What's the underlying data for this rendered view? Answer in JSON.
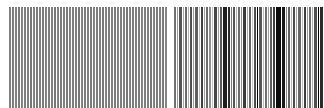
{
  "figure": {
    "kind": "barcode-stripe-pattern",
    "width": 324,
    "height": 108,
    "background_color": "#ffffff"
  },
  "chart_data": {
    "type": "bar",
    "subtitle": "",
    "xlabel": "",
    "ylabel": "",
    "grid": false,
    "legend": null,
    "axis_ticks": [],
    "annotations": [],
    "xlim": [
      0,
      324
    ],
    "ylim": [
      0,
      108
    ],
    "bar_top": 7,
    "bar_bottom": 108,
    "background_color": "#ffffff",
    "regions": [
      {
        "name": "regular-grating",
        "x_start": 8,
        "x_end": 168,
        "description": "uniform periodic grating, ~3px period, constant mid-gray bars",
        "period": 3,
        "bar_color": "#808080"
      },
      {
        "name": "separator-gap",
        "x_start": 168,
        "x_end": 174,
        "description": "wide white quiet zone separating the two halves",
        "bar_color": "#ffffff"
      },
      {
        "name": "irregular-barcode",
        "x_start": 174,
        "x_end": 324,
        "description": "irregular bars of varying width and darkness",
        "bar_color": "#000000"
      }
    ],
    "categories": [
      "b1",
      "b2",
      "b3",
      "b4",
      "b5",
      "b6",
      "b7",
      "b8",
      "b9",
      "b10",
      "b11",
      "b12",
      "b13",
      "b14",
      "b15",
      "b16",
      "b17",
      "b18",
      "b19",
      "b20",
      "b21",
      "b22",
      "b23",
      "b24",
      "b25",
      "b26",
      "b27",
      "b28",
      "b29",
      "b30",
      "b31",
      "b32",
      "b33",
      "b34",
      "b35",
      "b36",
      "b37",
      "b38",
      "b39",
      "b40",
      "b41",
      "b42",
      "b43",
      "b44",
      "b45",
      "b46",
      "b47",
      "b48",
      "b49",
      "b50",
      "b51",
      "b52",
      "b53",
      "b54",
      "b55",
      "b56",
      "b57",
      "b58",
      "b59",
      "b60",
      "b61",
      "b62",
      "b63",
      "b64",
      "b65",
      "b66",
      "b67",
      "b68",
      "b69",
      "b70",
      "b71",
      "b72",
      "b73",
      "b74",
      "b75",
      "b76",
      "b77",
      "b78",
      "b79",
      "b80",
      "b81",
      "b82",
      "b83",
      "b84",
      "b85",
      "b86",
      "b87",
      "b88",
      "b89",
      "b90",
      "b91",
      "b92",
      "b93",
      "b94",
      "b95",
      "b96",
      "b97",
      "b98",
      "b99",
      "b100",
      "b101",
      "b102",
      "b103",
      "b104",
      "b105",
      "b106",
      "b107",
      "b108",
      "b109",
      "b110",
      "b111",
      "b112",
      "b113",
      "b114",
      "b115",
      "b116",
      "b117",
      "b118",
      "b119",
      "b120",
      "b121",
      "b122",
      "b123",
      "b124",
      "b125",
      "b126",
      "b127",
      "b128",
      "b129",
      "b130"
    ],
    "bars": [
      {
        "x": 9,
        "w": 2,
        "c": "#808080"
      },
      {
        "x": 12,
        "w": 2,
        "c": "#7d7d7d"
      },
      {
        "x": 15,
        "w": 2,
        "c": "#808080"
      },
      {
        "x": 18,
        "w": 2,
        "c": "#7a7a7a"
      },
      {
        "x": 21,
        "w": 2,
        "c": "#828282"
      },
      {
        "x": 24,
        "w": 2,
        "c": "#7d7d7d"
      },
      {
        "x": 27,
        "w": 2,
        "c": "#808080"
      },
      {
        "x": 30,
        "w": 2,
        "c": "#787878"
      },
      {
        "x": 33,
        "w": 2,
        "c": "#828282"
      },
      {
        "x": 36,
        "w": 2,
        "c": "#7d7d7d"
      },
      {
        "x": 39,
        "w": 2,
        "c": "#808080"
      },
      {
        "x": 42,
        "w": 2,
        "c": "#7a7a7a"
      },
      {
        "x": 45,
        "w": 2,
        "c": "#828282"
      },
      {
        "x": 48,
        "w": 2,
        "c": "#7d7d7d"
      },
      {
        "x": 51,
        "w": 2,
        "c": "#808080"
      },
      {
        "x": 54,
        "w": 2,
        "c": "#787878"
      },
      {
        "x": 57,
        "w": 2,
        "c": "#828282"
      },
      {
        "x": 60,
        "w": 2,
        "c": "#7d7d7d"
      },
      {
        "x": 63,
        "w": 2,
        "c": "#808080"
      },
      {
        "x": 66,
        "w": 2,
        "c": "#7a7a7a"
      },
      {
        "x": 69,
        "w": 2,
        "c": "#828282"
      },
      {
        "x": 72,
        "w": 2,
        "c": "#7d7d7d"
      },
      {
        "x": 75,
        "w": 2,
        "c": "#808080"
      },
      {
        "x": 78,
        "w": 2,
        "c": "#787878"
      },
      {
        "x": 81,
        "w": 2,
        "c": "#828282"
      },
      {
        "x": 84,
        "w": 2,
        "c": "#7d7d7d"
      },
      {
        "x": 87,
        "w": 2,
        "c": "#808080"
      },
      {
        "x": 90,
        "w": 2,
        "c": "#7a7a7a"
      },
      {
        "x": 93,
        "w": 2,
        "c": "#828282"
      },
      {
        "x": 96,
        "w": 2,
        "c": "#7d7d7d"
      },
      {
        "x": 99,
        "w": 2,
        "c": "#808080"
      },
      {
        "x": 102,
        "w": 2,
        "c": "#787878"
      },
      {
        "x": 105,
        "w": 2,
        "c": "#828282"
      },
      {
        "x": 108,
        "w": 2,
        "c": "#7d7d7d"
      },
      {
        "x": 111,
        "w": 2,
        "c": "#808080"
      },
      {
        "x": 114,
        "w": 2,
        "c": "#7a7a7a"
      },
      {
        "x": 117,
        "w": 2,
        "c": "#828282"
      },
      {
        "x": 120,
        "w": 2,
        "c": "#7d7d7d"
      },
      {
        "x": 123,
        "w": 2,
        "c": "#808080"
      },
      {
        "x": 126,
        "w": 2,
        "c": "#787878"
      },
      {
        "x": 129,
        "w": 2,
        "c": "#828282"
      },
      {
        "x": 132,
        "w": 2,
        "c": "#7d7d7d"
      },
      {
        "x": 135,
        "w": 2,
        "c": "#808080"
      },
      {
        "x": 138,
        "w": 2,
        "c": "#7a7a7a"
      },
      {
        "x": 141,
        "w": 2,
        "c": "#828282"
      },
      {
        "x": 144,
        "w": 2,
        "c": "#7d7d7d"
      },
      {
        "x": 147,
        "w": 2,
        "c": "#808080"
      },
      {
        "x": 150,
        "w": 2,
        "c": "#787878"
      },
      {
        "x": 153,
        "w": 2,
        "c": "#828282"
      },
      {
        "x": 156,
        "w": 2,
        "c": "#7d7d7d"
      },
      {
        "x": 159,
        "w": 2,
        "c": "#808080"
      },
      {
        "x": 162,
        "w": 2,
        "c": "#7a7a7a"
      },
      {
        "x": 165,
        "w": 2,
        "c": "#858585"
      },
      {
        "x": 174,
        "w": 2,
        "c": "#6e6e6e"
      },
      {
        "x": 177,
        "w": 1,
        "c": "#9a9a9a"
      },
      {
        "x": 179,
        "w": 3,
        "c": "#545454"
      },
      {
        "x": 183,
        "w": 1,
        "c": "#a8a8a8"
      },
      {
        "x": 185,
        "w": 2,
        "c": "#6a6a6a"
      },
      {
        "x": 188,
        "w": 1,
        "c": "#b4b4b4"
      },
      {
        "x": 190,
        "w": 2,
        "c": "#4e4e4e"
      },
      {
        "x": 193,
        "w": 1,
        "c": "#9c9c9c"
      },
      {
        "x": 195,
        "w": 3,
        "c": "#5f5f5f"
      },
      {
        "x": 199,
        "w": 1,
        "c": "#bcbcbc"
      },
      {
        "x": 201,
        "w": 2,
        "c": "#3f3f3f"
      },
      {
        "x": 204,
        "w": 1,
        "c": "#a2a2a2"
      },
      {
        "x": 206,
        "w": 2,
        "c": "#6b6b6b"
      },
      {
        "x": 209,
        "w": 2,
        "c": "#8d8d8d"
      },
      {
        "x": 212,
        "w": 1,
        "c": "#c4c4c4"
      },
      {
        "x": 214,
        "w": 3,
        "c": "#474747"
      },
      {
        "x": 218,
        "w": 1,
        "c": "#9e9e9e"
      },
      {
        "x": 220,
        "w": 2,
        "c": "#5a5a5a"
      },
      {
        "x": 223,
        "w": 4,
        "c": "#1f1f1f"
      },
      {
        "x": 228,
        "w": 2,
        "c": "#2d2d2d"
      },
      {
        "x": 231,
        "w": 1,
        "c": "#7b7b7b"
      },
      {
        "x": 233,
        "w": 2,
        "c": "#565656"
      },
      {
        "x": 236,
        "w": 1,
        "c": "#b0b0b0"
      },
      {
        "x": 238,
        "w": 2,
        "c": "#6d6d6d"
      },
      {
        "x": 241,
        "w": 1,
        "c": "#8f8f8f"
      },
      {
        "x": 243,
        "w": 3,
        "c": "#3a3a3a"
      },
      {
        "x": 247,
        "w": 1,
        "c": "#a6a6a6"
      },
      {
        "x": 249,
        "w": 2,
        "c": "#636363"
      },
      {
        "x": 252,
        "w": 1,
        "c": "#c8c8c8"
      },
      {
        "x": 254,
        "w": 2,
        "c": "#4c4c4c"
      },
      {
        "x": 257,
        "w": 1,
        "c": "#9494949"
      },
      {
        "x": 259,
        "w": 3,
        "c": "#585858"
      },
      {
        "x": 263,
        "w": 1,
        "c": "#bdbdbd"
      },
      {
        "x": 265,
        "w": 2,
        "c": "#707070"
      },
      {
        "x": 268,
        "w": 1,
        "c": "#a0a0a0"
      },
      {
        "x": 270,
        "w": 2,
        "c": "#5d5d5d"
      },
      {
        "x": 273,
        "w": 2,
        "c": "#3c3c3c"
      },
      {
        "x": 276,
        "w": 5,
        "c": "#0c0c0c"
      },
      {
        "x": 282,
        "w": 3,
        "c": "#1a1a1a"
      },
      {
        "x": 286,
        "w": 1,
        "c": "#8a8a8a"
      },
      {
        "x": 288,
        "w": 2,
        "c": "#606060"
      },
      {
        "x": 291,
        "w": 1,
        "c": "#b8b8b8"
      },
      {
        "x": 293,
        "w": 2,
        "c": "#4a4a4a"
      },
      {
        "x": 296,
        "w": 1,
        "c": "#a4a4a4"
      },
      {
        "x": 298,
        "w": 3,
        "c": "#666666"
      },
      {
        "x": 302,
        "w": 1,
        "c": "#c0c0c0"
      },
      {
        "x": 304,
        "w": 2,
        "c": "#3e3e3e"
      },
      {
        "x": 307,
        "w": 1,
        "c": "#989898"
      },
      {
        "x": 309,
        "w": 2,
        "c": "#6c6c6c"
      },
      {
        "x": 312,
        "w": 1,
        "c": "#aeaeae"
      },
      {
        "x": 314,
        "w": 3,
        "c": "#505050"
      },
      {
        "x": 318,
        "w": 1,
        "c": "#9090909"
      },
      {
        "x": 320,
        "w": 3,
        "c": "#2b2b2b"
      }
    ]
  }
}
